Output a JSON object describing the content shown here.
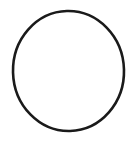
{
  "canvas": {
    "width": 140,
    "height": 146,
    "background_color": "#ffffff",
    "title": "Circle Outline"
  },
  "figure": {
    "name": "circle-outline",
    "shapes": [
      {
        "type": "ellipse",
        "name": "circle",
        "center_x": 68.5,
        "center_y": 71.0,
        "radius_x": 55.5,
        "radius_y": 60.0,
        "stroke_color": "#1a1a1a",
        "stroke_width": 2.6,
        "fill": "none",
        "rotation_deg": -1.5
      }
    ],
    "bounds": {
      "left": 13,
      "top": 11,
      "right": 124,
      "bottom": 131
    }
  },
  "labels": {
    "text_items": []
  }
}
